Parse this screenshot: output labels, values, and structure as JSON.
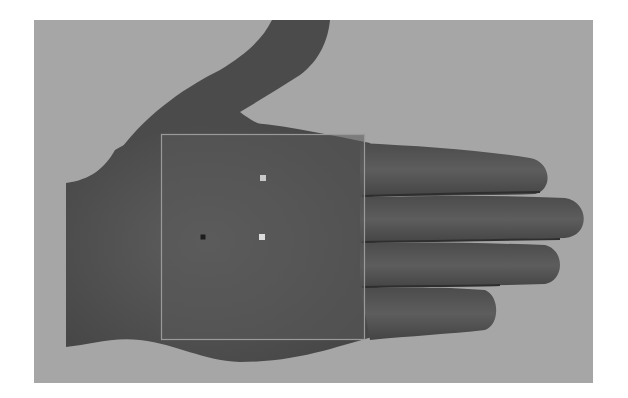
{
  "image": {
    "subject": "hand palm with region of interest",
    "background_color": "#a6a6a6",
    "skin_color": "#555555",
    "frame": {
      "x": 34,
      "y": 20,
      "width": 559,
      "height": 363
    }
  },
  "roi": {
    "x": 161,
    "y": 134,
    "width": 203,
    "height": 205,
    "stroke_color": "#9a9a9a",
    "fill_color": "#5a5a5a"
  },
  "markers": [
    {
      "name": "marker-top",
      "x": 263,
      "y": 178,
      "size": 6,
      "color": "#c9c9c9"
    },
    {
      "name": "marker-center",
      "x": 262,
      "y": 237,
      "size": 6,
      "color": "#dcdcdc"
    },
    {
      "name": "marker-dark",
      "x": 203,
      "y": 237,
      "size": 5,
      "color": "#1c1c1c"
    }
  ]
}
